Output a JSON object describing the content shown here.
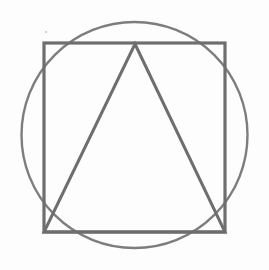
{
  "canvas": {
    "width": 269,
    "height": 270,
    "background_color": "#fdfdfd",
    "title": "Circle with inscribed square and inscribed triangle"
  },
  "palette": {
    "square_stroke": "#6e6e6e",
    "circle_stroke": "#7d7d7d",
    "triangle_stroke": "#6e6e6e",
    "speck": "#b9b9b9"
  },
  "shapes": {
    "circle": {
      "name": "circle",
      "center_x": 134.5,
      "center_y": 135,
      "radius": 113,
      "stroke_color": "#7d7d7d",
      "stroke_width": 2.4,
      "fill": "none"
    },
    "square": {
      "name": "square",
      "x": 44,
      "y": 43,
      "width": 181,
      "height": 189,
      "stroke_color": "#6e6e6e",
      "stroke_width": 3.2,
      "fill": "none",
      "corners": [
        {
          "label": "top-left",
          "x": 44,
          "y": 43
        },
        {
          "label": "top-right",
          "x": 225,
          "y": 43
        },
        {
          "label": "bottom-right",
          "x": 225,
          "y": 232
        },
        {
          "label": "bottom-left",
          "x": 44,
          "y": 232
        }
      ]
    },
    "triangle": {
      "name": "triangle",
      "points": "135,44 225,232 44,232",
      "stroke_color": "#6e6e6e",
      "stroke_width": 3.0,
      "fill": "none",
      "vertices": [
        {
          "label": "apex",
          "x": 135,
          "y": 44
        },
        {
          "label": "base-right",
          "x": 225,
          "y": 232
        },
        {
          "label": "base-left",
          "x": 44,
          "y": 232
        }
      ]
    }
  },
  "artifacts": {
    "speck": {
      "name": "scan-speck",
      "x": 45,
      "y": 31,
      "color": "#b9b9b9"
    }
  }
}
